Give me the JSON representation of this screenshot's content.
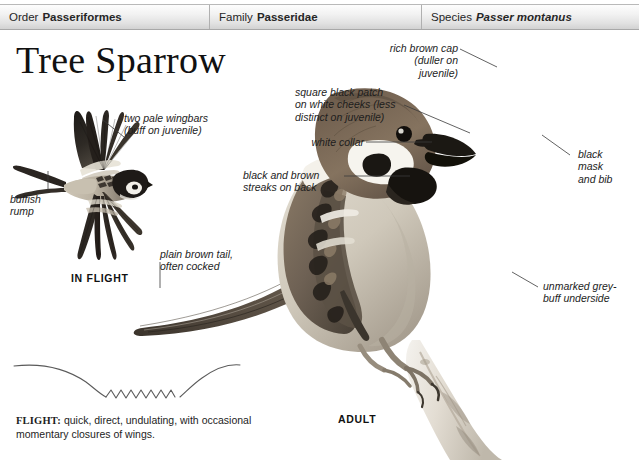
{
  "taxonomy": {
    "order": {
      "label": "Order",
      "value": "Passeriformes",
      "italic": false
    },
    "family": {
      "label": "Family",
      "value": "Passeridae",
      "italic": false
    },
    "species": {
      "label": "Species",
      "value": "Passer montanus",
      "italic": true
    }
  },
  "title": "Tree Sparrow",
  "annotations": {
    "wingbars": "two pale wingbars\n(buff on juvenile)",
    "rump": "buffish\nrump",
    "tail": "plain brown tail,\noften cocked",
    "cap": "rich brown cap\n(duller on\njuvenile)",
    "cheek_patch": "square black patch\non white cheeks (less\ndistinct on juvenile)",
    "collar": "white collar",
    "back_streaks": "black and brown\nstreaks on back",
    "mask_bib": "black\nmask\nand bib",
    "underside": "unmarked grey-\nbuff underside"
  },
  "captions": {
    "in_flight": "IN FLIGHT",
    "adult": "ADULT"
  },
  "flight_note": {
    "label": "FLIGHT:",
    "text": " quick, direct, undulating, with occasional momentary closures of wings."
  },
  "colors": {
    "page_background": "#ffffff",
    "bar_top": "#fdfdfd",
    "bar_bottom": "#d2d2d2",
    "bar_border": "#a8a8a8",
    "text": "#1d1d1d",
    "leader_line": "#3a3a3a",
    "plumage_cap": "#7d6a57",
    "plumage_dark": "#2b2622",
    "plumage_pale": "#d9d2c6",
    "perch": "#e8e4dc"
  }
}
